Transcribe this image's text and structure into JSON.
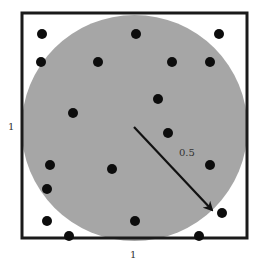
{
  "diagram": {
    "square": {
      "x": 22,
      "y": 13,
      "size": 225,
      "stroke": "#1a1a1a",
      "side_label": "1"
    },
    "circle": {
      "cx": 134.5,
      "cy": 128,
      "r": 113,
      "fill": "#a6a6a6",
      "radius_label": "0.5"
    },
    "arrow": {
      "x1": 134,
      "y1": 127,
      "x2": 212,
      "y2": 210,
      "color": "#111111"
    },
    "labels": {
      "left_side": "1",
      "bottom_side": "1",
      "radius": "0.5"
    },
    "points": [
      {
        "x": 42,
        "y": 34
      },
      {
        "x": 136,
        "y": 34
      },
      {
        "x": 219,
        "y": 34
      },
      {
        "x": 41,
        "y": 62
      },
      {
        "x": 98,
        "y": 62
      },
      {
        "x": 172,
        "y": 62
      },
      {
        "x": 210,
        "y": 62
      },
      {
        "x": 158,
        "y": 99
      },
      {
        "x": 73,
        "y": 113
      },
      {
        "x": 168,
        "y": 133
      },
      {
        "x": 50,
        "y": 165
      },
      {
        "x": 210,
        "y": 165
      },
      {
        "x": 112,
        "y": 169
      },
      {
        "x": 47,
        "y": 189
      },
      {
        "x": 222,
        "y": 213
      },
      {
        "x": 47,
        "y": 221
      },
      {
        "x": 135,
        "y": 221
      },
      {
        "x": 69,
        "y": 236
      },
      {
        "x": 199,
        "y": 236
      }
    ],
    "point_radius": 5,
    "point_color": "#0d0d0d"
  }
}
